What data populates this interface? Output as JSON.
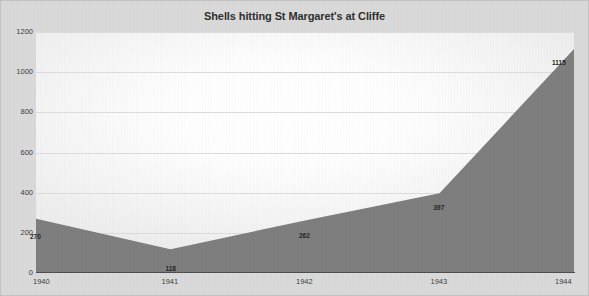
{
  "chart_data": {
    "type": "area",
    "title": "Shells hitting St Margaret's at Cliffe",
    "xlabel": "",
    "ylabel": "",
    "categories": [
      "1940",
      "1941",
      "1942",
      "1943",
      "1944"
    ],
    "values": [
      270,
      118,
      262,
      397,
      1115
    ],
    "data_labels": [
      "270",
      "118",
      "262",
      "397",
      "1115"
    ],
    "ylim": [
      0,
      1200
    ],
    "yticks": [
      0,
      200,
      400,
      600,
      800,
      1000,
      1200
    ],
    "ytick_labels": [
      "0",
      "200",
      "400",
      "600",
      "800",
      "1000",
      "1200"
    ],
    "grid": true,
    "legend": false,
    "legend_position": "none",
    "series": [
      {
        "name": "Shells",
        "values": [
          270,
          118,
          262,
          397,
          1115
        ]
      }
    ],
    "colors": {
      "area_fill": "#7d7d7d",
      "plot_background": "#ffffff",
      "page_background": "#d9d9d9",
      "gridline": "#dcdcdc",
      "axis_line": "#4c4c4c",
      "title_text": "#2e2e2e",
      "tick_text": "#3b3b3b",
      "data_label_text": "#242424"
    }
  }
}
